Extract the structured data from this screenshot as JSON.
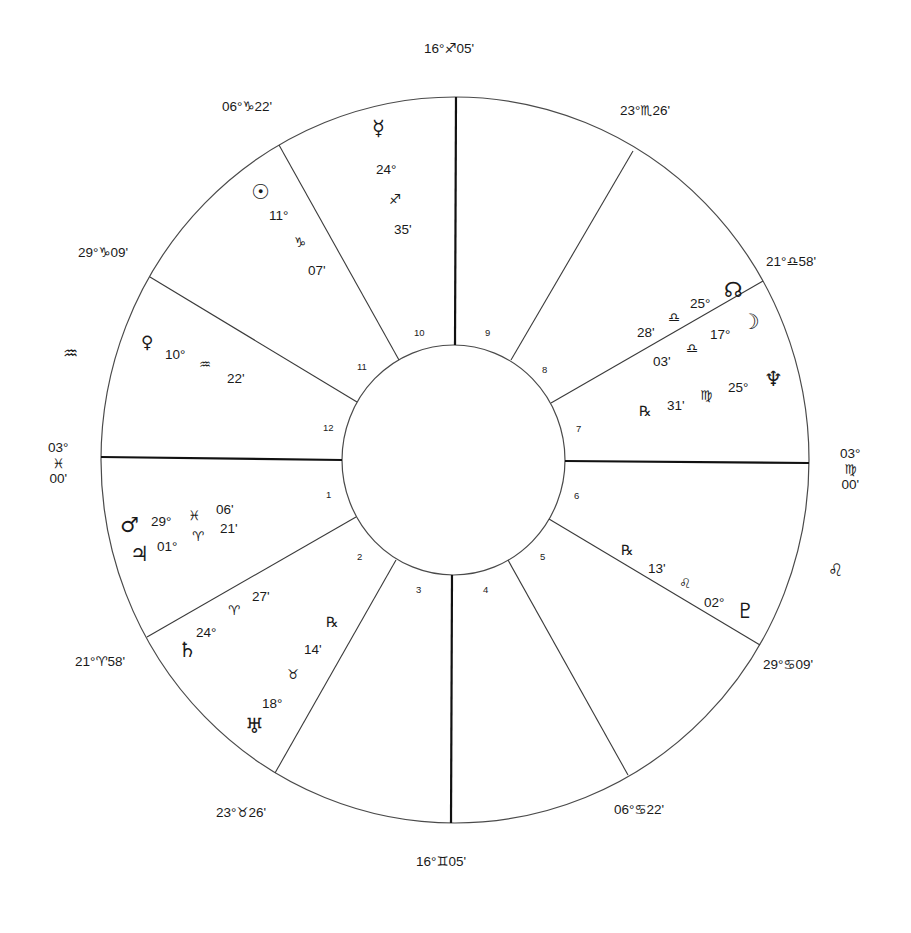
{
  "chart": {
    "type": "natal-wheel",
    "colors": {
      "line": "#3a3a3a",
      "axis": "#111111",
      "text": "#1a1a1a",
      "background": "#ffffff"
    }
  },
  "cusps": {
    "mc": {
      "deg": "16°",
      "sign": "♐",
      "min": "05'"
    },
    "c11": {
      "deg": "06°",
      "sign": "♑",
      "min": "22'"
    },
    "c12": {
      "deg": "29°",
      "sign": "♑",
      "min": "09'"
    },
    "asc": {
      "deg": "03°",
      "sign": "♓",
      "min": "00'"
    },
    "c2": {
      "deg": "21°",
      "sign": "♈",
      "min": "58'"
    },
    "c3": {
      "deg": "23°",
      "sign": "♉",
      "min": "26'"
    },
    "ic": {
      "deg": "16°",
      "sign": "♊",
      "min": "05'"
    },
    "c5": {
      "deg": "06°",
      "sign": "♋",
      "min": "22'"
    },
    "c6": {
      "deg": "29°",
      "sign": "♋",
      "min": "09'"
    },
    "dsc": {
      "deg": "03°",
      "sign": "♍",
      "min": "00'"
    },
    "c8": {
      "deg": "21°",
      "sign": "♎",
      "min": "58'"
    },
    "c9": {
      "deg": "23°",
      "sign": "♏",
      "min": "26'"
    }
  },
  "intercepted": {
    "left": "♒",
    "right": "♌"
  },
  "houses": [
    "1",
    "2",
    "3",
    "4",
    "5",
    "6",
    "7",
    "8",
    "9",
    "10",
    "11",
    "12"
  ],
  "planets": {
    "mercury": {
      "glyph": "☿",
      "deg": "24°",
      "sign": "♐",
      "min": "35'"
    },
    "sun": {
      "glyph": "☉",
      "deg": "11°",
      "sign": "♑",
      "min": "07'"
    },
    "venus": {
      "glyph": "♀",
      "deg": "10°",
      "sign": "♒",
      "min": "22'"
    },
    "mars": {
      "glyph": "♂",
      "deg": "29°",
      "sign": "♓",
      "min": "06'"
    },
    "jupiter": {
      "glyph": "♃",
      "deg": "01°",
      "sign": "♈",
      "min": "21'"
    },
    "saturn": {
      "glyph": "♄",
      "deg": "24°",
      "sign": "♈",
      "min": "27'"
    },
    "uranus": {
      "glyph": "♅",
      "deg": "18°",
      "sign": "♉",
      "min": "14'",
      "retro": "℞"
    },
    "pluto": {
      "glyph": "♇",
      "deg": "02°",
      "sign": "♌",
      "min": "13'",
      "retro": "℞"
    },
    "neptune": {
      "glyph": "♆",
      "deg": "25°",
      "sign": "♍",
      "min": "31'",
      "retro": "℞"
    },
    "moon": {
      "glyph": "☽",
      "deg": "17°",
      "sign": "♎",
      "min": "03'"
    },
    "node": {
      "glyph": "☊",
      "deg": "25°",
      "sign": "♎",
      "min": "28'"
    }
  }
}
